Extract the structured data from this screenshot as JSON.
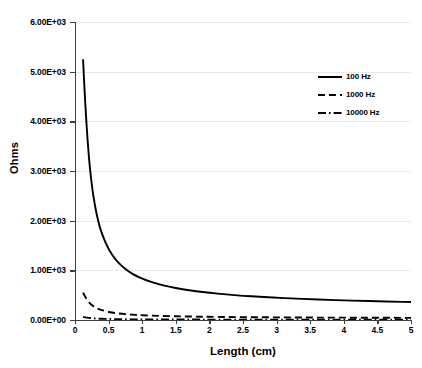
{
  "chart_data": {
    "type": "line",
    "title": "",
    "xlabel": "Length (cm)",
    "ylabel": "Ohms",
    "xlim": [
      0,
      5
    ],
    "ylim": [
      0,
      6000
    ],
    "grid": "horizontal",
    "legend_position": "top-right",
    "xticks": [
      "0",
      "0.5",
      "1",
      "1.5",
      "2",
      "2.5",
      "3",
      "3.5",
      "4",
      "4.5",
      "5"
    ],
    "xtick_values": [
      0,
      0.5,
      1,
      1.5,
      2,
      2.5,
      3,
      3.5,
      4,
      4.5,
      5
    ],
    "yticks": [
      "0.00E+00",
      "1.00E+03",
      "2.00E+03",
      "3.00E+03",
      "4.00E+03",
      "5.00E+03",
      "6.00E+03"
    ],
    "ytick_values": [
      0,
      1000,
      2000,
      3000,
      4000,
      5000,
      6000
    ],
    "x": [
      0.12,
      0.15,
      0.2,
      0.25,
      0.3,
      0.35,
      0.4,
      0.5,
      0.6,
      0.7,
      0.8,
      0.9,
      1.0,
      1.2,
      1.4,
      1.6,
      1.8,
      2.0,
      2.25,
      2.5,
      2.75,
      3.0,
      3.25,
      3.5,
      3.75,
      4.0,
      4.25,
      4.5,
      4.75,
      5.0
    ],
    "series": [
      {
        "name": "100 Hz",
        "style": "solid",
        "color": "#000000",
        "values": [
          5250,
          4400,
          3350,
          2700,
          2270,
          1960,
          1730,
          1420,
          1220,
          1080,
          975,
          895,
          830,
          735,
          670,
          620,
          580,
          548,
          515,
          488,
          466,
          448,
          432,
          418,
          406,
          395,
          386,
          377,
          369,
          362
        ]
      },
      {
        "name": "1000 Hz",
        "style": "dashed",
        "color": "#000000",
        "values": [
          550,
          470,
          365,
          300,
          255,
          222,
          198,
          163,
          140,
          124,
          112,
          103,
          96,
          85,
          78,
          72,
          68,
          64,
          60,
          57,
          55,
          53,
          51,
          49,
          48,
          47,
          46,
          45,
          44,
          43
        ]
      },
      {
        "name": "10000 Hz",
        "style": "dashdot",
        "color": "#000000",
        "values": [
          62,
          54,
          43,
          36,
          31,
          27,
          24,
          20,
          17,
          15,
          14,
          13,
          12,
          11,
          10,
          9.5,
          9,
          8.5,
          8,
          7.6,
          7.3,
          7,
          6.8,
          6.6,
          6.4,
          6.2,
          6.1,
          6.0,
          5.9,
          5.8
        ]
      }
    ]
  },
  "legend": {
    "items": [
      {
        "label": "100 Hz"
      },
      {
        "label": "1000 Hz"
      },
      {
        "label": "10000 Hz"
      }
    ]
  }
}
